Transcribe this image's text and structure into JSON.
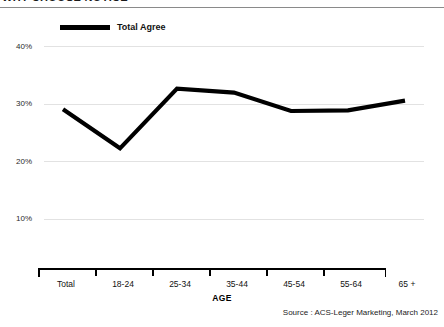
{
  "slide": {
    "title": "WHY CHOOSE NOTICE",
    "source_note": "Source : ACS-Leger Marketing, March 2012",
    "axis_title": "AGE"
  },
  "legend": {
    "entries": [
      {
        "label": "Total Agree",
        "color": "#000000"
      }
    ]
  },
  "chart_data": {
    "type": "line",
    "title": "",
    "xlabel": "AGE",
    "ylabel": "",
    "categories": [
      "Total",
      "18-24",
      "25-34",
      "35-44",
      "45-54",
      "55-64",
      "65 +"
    ],
    "series": [
      {
        "name": "Total Agree",
        "color": "#000000",
        "values": [
          29.0,
          22.2,
          32.6,
          31.9,
          28.7,
          28.8,
          30.5
        ]
      }
    ],
    "ylim": [
      0,
      40
    ],
    "yticks": [
      10,
      20,
      30,
      40
    ],
    "ytick_labels": [
      "10%",
      "20%",
      "30%",
      "40%"
    ],
    "grid": true,
    "legend_position": "top-left"
  }
}
